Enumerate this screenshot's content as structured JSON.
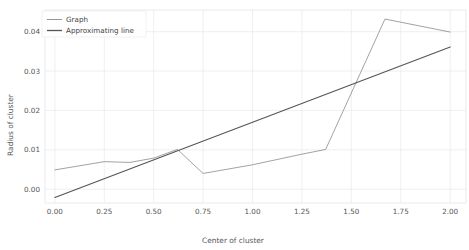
{
  "chart_data": {
    "type": "line",
    "title": "",
    "xlabel": "Center of cluster",
    "ylabel": "Radius of cluster",
    "xlim": [
      -0.05,
      2.08
    ],
    "ylim": [
      -0.0035,
      0.0455
    ],
    "xticks": [
      0.0,
      0.25,
      0.5,
      0.75,
      1.0,
      1.25,
      1.5,
      1.75,
      2.0
    ],
    "xticklabels": [
      "0.00",
      "0.25",
      "0.50",
      "0.75",
      "1.00",
      "1.25",
      "1.50",
      "1.75",
      "2.00"
    ],
    "yticks": [
      0.0,
      0.01,
      0.02,
      0.03,
      0.04
    ],
    "yticklabels": [
      "0.00",
      "0.01",
      "0.02",
      "0.03",
      "0.04"
    ],
    "grid": true,
    "grid_color": "#e8e8f0",
    "legend_position": "upper left",
    "series": [
      {
        "name": "Graph",
        "color": "#8a8a8a",
        "linewidth": 0.8,
        "points": [
          [
            0.0,
            0.0049
          ],
          [
            0.25,
            0.007
          ],
          [
            0.38,
            0.0068
          ],
          [
            0.5,
            0.0079
          ],
          [
            0.62,
            0.0101
          ],
          [
            0.75,
            0.004
          ],
          [
            1.0,
            0.0062
          ],
          [
            1.25,
            0.0089
          ],
          [
            1.37,
            0.0101
          ],
          [
            1.67,
            0.0432
          ],
          [
            2.0,
            0.0399
          ]
        ]
      },
      {
        "name": "Approximating line",
        "color": "#555555",
        "linewidth": 1.1,
        "points": [
          [
            0.0,
            -0.0021
          ],
          [
            2.0,
            0.0361
          ]
        ]
      }
    ]
  },
  "legend": {
    "entries": [
      {
        "label": "Graph"
      },
      {
        "label": "Approximating line"
      }
    ]
  },
  "axes": {
    "xlabel": "Center of cluster",
    "ylabel": "Radius of cluster"
  }
}
